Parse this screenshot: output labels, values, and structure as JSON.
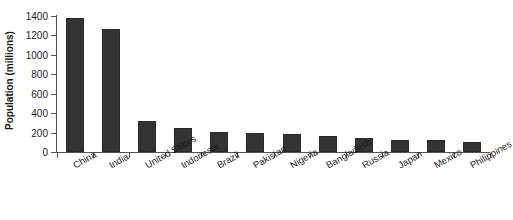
{
  "chart_data": {
    "type": "bar",
    "title": "",
    "subtitle": "",
    "xlabel": "",
    "ylabel": "Population (millions)",
    "categories": [
      "China",
      "India",
      "United States",
      "Indonesia",
      "Brazil",
      "Pakistan",
      "Nigeria",
      "Bangladesh",
      "Russia",
      "Japan",
      "Mexico",
      "Philippines"
    ],
    "values": [
      1380,
      1270,
      320,
      250,
      205,
      195,
      190,
      165,
      145,
      127,
      127,
      105
    ],
    "ylim": [
      0,
      1400
    ],
    "yticks": [
      0,
      200,
      400,
      600,
      800,
      1000,
      1200,
      1400
    ],
    "ytick_labels": [
      "0",
      "200",
      "400",
      "600",
      "800",
      "1000",
      "1200",
      "1400"
    ],
    "grid": false,
    "legend": "none",
    "bar_color": "#333333",
    "axis_color": "#555555",
    "background": "#ffffff",
    "xlabel_rotation_deg": -30,
    "series": [
      {
        "name": "Population",
        "values": [
          1380,
          1270,
          320,
          250,
          205,
          195,
          190,
          165,
          145,
          127,
          127,
          105
        ]
      }
    ]
  }
}
